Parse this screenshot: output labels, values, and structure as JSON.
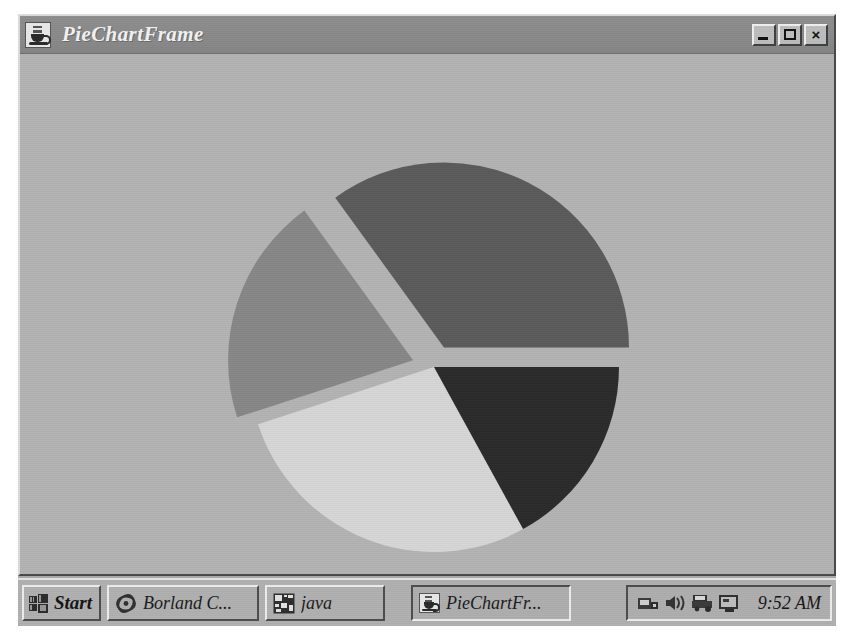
{
  "window": {
    "title": "PieChartFrame",
    "icon": "java-coffee-cup-icon",
    "buttons": {
      "minimize": "_",
      "maximize": "□",
      "close": "×"
    }
  },
  "chart_data": {
    "type": "pie",
    "title": "",
    "labels": [
      "Slice 1",
      "Slice 2",
      "Slice 3",
      "Slice 4"
    ],
    "values": [
      35,
      20,
      28,
      17
    ],
    "colors": [
      "#5b5b5b",
      "#878787",
      "#d6d6d6",
      "#2b2b2b"
    ],
    "exploded": [
      true,
      true,
      false,
      false
    ],
    "start_angle_deg": 0,
    "direction": "counterclockwise",
    "legend": "none",
    "grid": false,
    "background": "#b3b3b3"
  },
  "taskbar": {
    "start_label": "Start",
    "start_icon": "windows-logo-icon",
    "tasks": [
      {
        "label": "Borland C...",
        "icon": "borland-icon"
      },
      {
        "label": "java",
        "icon": "console-icon"
      },
      {
        "label": "PieChartFr...",
        "icon": "java-coffee-cup-icon"
      }
    ],
    "tray_icons": [
      "modem-icon",
      "volume-speaker-icon",
      "printer-icon",
      "display-icon"
    ],
    "clock": "9:52 AM"
  },
  "colors": {
    "desktop": "#a9a9a9",
    "window_face": "#b3b3b3",
    "titlebar": "#8a8a8a",
    "titlebar_text": "#f2f2f2",
    "taskbar": "#b0b0b0"
  }
}
